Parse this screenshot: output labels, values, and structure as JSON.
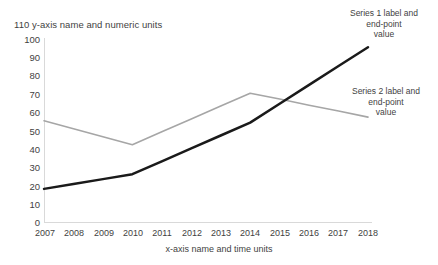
{
  "chart_data": {
    "type": "line",
    "title": "",
    "xlabel": "x-axis name and time units",
    "ylabel": "y-axis name and numeric units",
    "categories": [
      "2007",
      "2008",
      "2009",
      "2010",
      "2011",
      "2012",
      "2013",
      "2014",
      "2015",
      "2016",
      "2017",
      "2018"
    ],
    "x": [
      2007,
      2008,
      2009,
      2010,
      2011,
      2012,
      2013,
      2014,
      2015,
      2016,
      2017,
      2018
    ],
    "series": [
      {
        "name": "Series 1",
        "color": "#1a1a1a",
        "line_width": 2.5,
        "values": [
          18,
          20.7,
          23.3,
          26,
          33,
          40,
          47,
          54,
          64.3,
          74.5,
          84.8,
          95
        ],
        "endpoint_value": 95
      },
      {
        "name": "Series 2",
        "color": "#a6a6a6",
        "line_width": 1.6,
        "values": [
          55,
          50.7,
          46.3,
          42,
          49,
          56,
          63,
          70,
          66.8,
          63.5,
          60.3,
          57
        ],
        "endpoint_value": 57
      }
    ],
    "ylim": [
      0,
      110
    ],
    "yticks": [
      0,
      10,
      20,
      30,
      40,
      50,
      60,
      70,
      80,
      90,
      100,
      110
    ],
    "grid": false,
    "legend": "annotations-at-line-ends",
    "axis_color": "#d9d9d9"
  },
  "axes": {
    "y_title_line": "110 y-axis name and numeric units",
    "y_ticks": [
      "100",
      "90",
      "80",
      "70",
      "60",
      "50",
      "40",
      "30",
      "20",
      "10",
      "0"
    ],
    "x_ticks": [
      "2007",
      "2008",
      "2009",
      "2010",
      "2011",
      "2012",
      "2013",
      "2014",
      "2015",
      "2016",
      "2017",
      "2018"
    ],
    "x_title": "x-axis name and time units"
  },
  "annotations": {
    "series1": "Series 1 label and\nend-point\nvalue",
    "series2": "Series 2 label and\nend-point\nvalue"
  }
}
